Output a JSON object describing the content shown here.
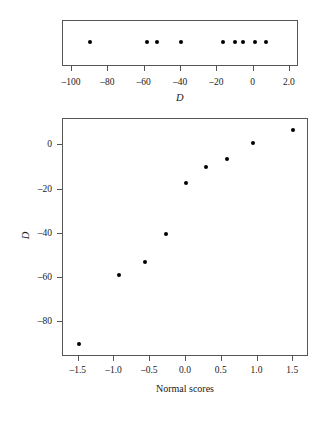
{
  "figure": {
    "caption": ""
  },
  "chart_data": [
    {
      "type": "scatter",
      "name": "dotplot",
      "title": "",
      "xlabel": "D",
      "ylabel": "",
      "xlim": [
        -105,
        25
      ],
      "ylim": [
        0,
        1
      ],
      "grid": false,
      "legend": false,
      "xticks": [
        -100,
        -80,
        -60,
        -40,
        -20,
        0,
        20
      ],
      "xtick_labels": [
        "–100",
        "–80",
        "–60",
        "–40",
        "–20",
        "0",
        "2.0"
      ],
      "x": [
        -90,
        -59,
        -53,
        -40,
        -17,
        -10,
        -6,
        1,
        7
      ],
      "y": [
        0.5,
        0.5,
        0.5,
        0.5,
        0.5,
        0.5,
        0.5,
        0.5,
        0.5
      ],
      "marker": "filled-circle",
      "marker_color": "#000000",
      "frame_color": "#555555"
    },
    {
      "type": "scatter",
      "name": "normal-probability-plot",
      "title": "",
      "xlabel": "Normal scores",
      "ylabel": "D",
      "xlim": [
        -1.72,
        1.72
      ],
      "ylim": [
        -96,
        12
      ],
      "grid": false,
      "legend": false,
      "xticks": [
        -1.5,
        -1.0,
        -0.5,
        0.0,
        0.5,
        1.0,
        1.5
      ],
      "xtick_labels": [
        "–1.5",
        "–1.0",
        "–0.5",
        "0.0",
        "0.5",
        "1.0",
        "1.5"
      ],
      "yticks": [
        0,
        -20,
        -40,
        -60,
        -80
      ],
      "ytick_labels": [
        "0",
        "–20",
        "–40",
        "–60",
        "–80"
      ],
      "x": [
        -1.49,
        -0.93,
        -0.57,
        -0.28,
        0.0,
        0.28,
        0.57,
        0.93,
        1.49
      ],
      "y": [
        -90,
        -59,
        -53,
        -40,
        -17,
        -10,
        -6,
        1,
        7
      ],
      "marker": "filled-circle",
      "marker_color": "#000000",
      "frame_color": "#555555"
    }
  ]
}
